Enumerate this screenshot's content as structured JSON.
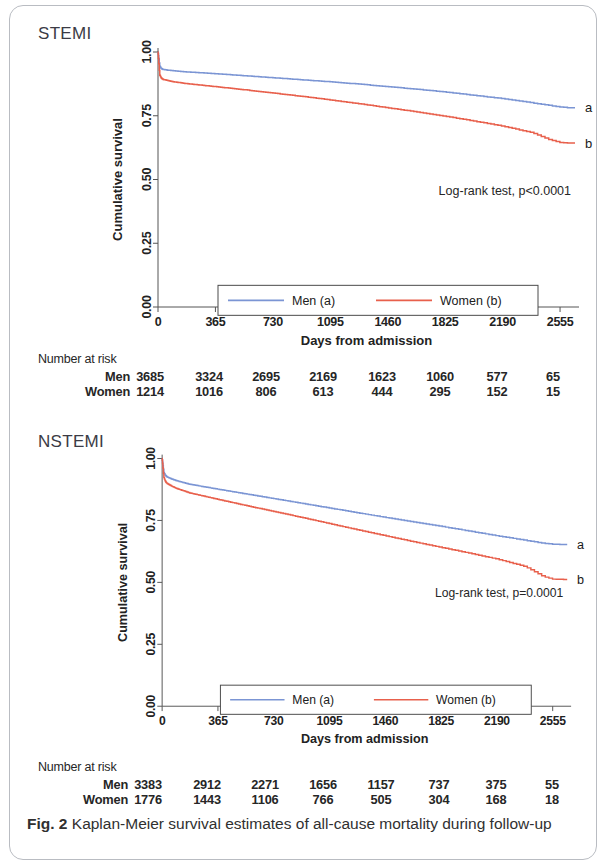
{
  "figure": {
    "caption_prefix": "Fig. 2",
    "caption_text": " Kaplan-Meier survival estimates of all-cause mortality during follow-up",
    "colors": {
      "men": "#7b95d4",
      "women": "#e8604c",
      "axis": "#555555",
      "frame": "#b9bcc2"
    }
  },
  "panels": [
    {
      "id": "stemi",
      "title": "STEMI",
      "annotation": "Log-rank test, p<0.0001",
      "curve_tags": {
        "men": "a",
        "women": "b"
      },
      "legend": {
        "men": "Men (a)",
        "women": "Women (b)"
      },
      "risk": {
        "heading": "Number at risk",
        "rows": [
          {
            "label": "Men",
            "values": [
              "3685",
              "3324",
              "2695",
              "2169",
              "1623",
              "1060",
              "577",
              "65"
            ]
          },
          {
            "label": "Women",
            "values": [
              "1214",
              "1016",
              "806",
              "613",
              "444",
              "295",
              "152",
              "15"
            ]
          }
        ]
      }
    },
    {
      "id": "nstemi",
      "title": "NSTEMI",
      "annotation": "Log-rank test, p=0.0001",
      "curve_tags": {
        "men": "a",
        "women": "b"
      },
      "legend": {
        "men": "Men (a)",
        "women": "Women (b)"
      },
      "risk": {
        "heading": "Number at risk",
        "rows": [
          {
            "label": "Men",
            "values": [
              "3383",
              "2912",
              "2271",
              "1656",
              "1157",
              "737",
              "375",
              "55"
            ]
          },
          {
            "label": "Women",
            "values": [
              "1776",
              "1443",
              "1106",
              "766",
              "505",
              "304",
              "168",
              "18"
            ]
          }
        ]
      }
    }
  ],
  "chart_data": [
    {
      "type": "line",
      "title": "STEMI",
      "subtitle": "Kaplan-Meier cumulative survival, STEMI patients",
      "xlabel": "Days from admission",
      "ylabel": "Cumulative survival",
      "xlim": [
        0,
        2650
      ],
      "ylim": [
        0,
        1
      ],
      "xticks": [
        0,
        365,
        730,
        1095,
        1460,
        1825,
        2190,
        2555
      ],
      "xticklabels": [
        "0",
        "365",
        "730",
        "1095",
        "1460",
        "1825",
        "2190",
        "2555"
      ],
      "yticks": [
        0.0,
        0.25,
        0.5,
        0.75,
        1.0
      ],
      "yticklabels": [
        "0.00",
        "0.25",
        "0.50",
        "0.75",
        "1.00"
      ],
      "grid": false,
      "legend_position": "lower center",
      "annotations": [
        "Log-rank test, p<0.0001"
      ],
      "series": [
        {
          "name": "Men (a)",
          "tag": "a",
          "color": "#7b95d4",
          "x": [
            0,
            10,
            20,
            30,
            60,
            90,
            180,
            365,
            548,
            730,
            913,
            1095,
            1278,
            1460,
            1643,
            1825,
            2008,
            2190,
            2373,
            2555,
            2620
          ],
          "y": [
            1.0,
            0.945,
            0.935,
            0.932,
            0.929,
            0.927,
            0.922,
            0.915,
            0.907,
            0.899,
            0.891,
            0.883,
            0.874,
            0.864,
            0.854,
            0.843,
            0.83,
            0.817,
            0.801,
            0.784,
            0.781
          ]
        },
        {
          "name": "Women (b)",
          "tag": "b",
          "color": "#e8604c",
          "x": [
            0,
            10,
            20,
            30,
            60,
            90,
            180,
            365,
            548,
            730,
            913,
            1095,
            1278,
            1460,
            1643,
            1825,
            2008,
            2190,
            2373,
            2490,
            2555,
            2620
          ],
          "y": [
            1.0,
            0.91,
            0.898,
            0.893,
            0.888,
            0.884,
            0.876,
            0.864,
            0.852,
            0.839,
            0.826,
            0.812,
            0.797,
            0.781,
            0.765,
            0.748,
            0.729,
            0.709,
            0.684,
            0.655,
            0.645,
            0.643
          ]
        }
      ],
      "risk_table": {
        "heading": "Number at risk",
        "times": [
          0,
          365,
          730,
          1095,
          1460,
          1825,
          2190,
          2555
        ],
        "rows": [
          {
            "label": "Men",
            "values": [
              3685,
              3324,
              2695,
              2169,
              1623,
              1060,
              577,
              65
            ]
          },
          {
            "label": "Women",
            "values": [
              1214,
              1016,
              806,
              613,
              444,
              295,
              152,
              15
            ]
          }
        ]
      }
    },
    {
      "type": "line",
      "title": "NSTEMI",
      "subtitle": "Kaplan-Meier cumulative survival, NSTEMI patients",
      "xlabel": "Days from admission",
      "ylabel": "Cumulative survival",
      "xlim": [
        0,
        2650
      ],
      "ylim": [
        0,
        1
      ],
      "xticks": [
        0,
        365,
        730,
        1095,
        1460,
        1825,
        2190,
        2555
      ],
      "xticklabels": [
        "0",
        "365",
        "730",
        "1095",
        "1460",
        "1825",
        "2190",
        "2555"
      ],
      "yticks": [
        0.0,
        0.25,
        0.5,
        0.75,
        1.0
      ],
      "yticklabels": [
        "0.00",
        "0.25",
        "0.50",
        "0.75",
        "1.00"
      ],
      "grid": false,
      "legend_position": "lower center",
      "annotations": [
        "Log-rank test, p=0.0001"
      ],
      "series": [
        {
          "name": "Men (a)",
          "tag": "a",
          "color": "#7b95d4",
          "x": [
            0,
            10,
            20,
            30,
            60,
            90,
            180,
            365,
            548,
            730,
            913,
            1095,
            1278,
            1460,
            1643,
            1825,
            2008,
            2190,
            2373,
            2490,
            2555,
            2620
          ],
          "y": [
            1.0,
            0.945,
            0.932,
            0.926,
            0.918,
            0.911,
            0.896,
            0.876,
            0.857,
            0.838,
            0.819,
            0.8,
            0.781,
            0.762,
            0.744,
            0.726,
            0.707,
            0.688,
            0.67,
            0.658,
            0.654,
            0.653
          ]
        },
        {
          "name": "Women (b)",
          "tag": "b",
          "color": "#e8604c",
          "x": [
            0,
            10,
            20,
            30,
            60,
            90,
            180,
            365,
            548,
            730,
            913,
            1095,
            1278,
            1460,
            1643,
            1825,
            2008,
            2190,
            2373,
            2490,
            2555,
            2620
          ],
          "y": [
            1.0,
            0.925,
            0.908,
            0.9,
            0.889,
            0.88,
            0.861,
            0.835,
            0.81,
            0.786,
            0.762,
            0.737,
            0.712,
            0.688,
            0.664,
            0.641,
            0.618,
            0.594,
            0.564,
            0.524,
            0.513,
            0.512
          ]
        }
      ],
      "risk_table": {
        "heading": "Number at risk",
        "times": [
          0,
          365,
          730,
          1095,
          1460,
          1825,
          2190,
          2555
        ],
        "rows": [
          {
            "label": "Men",
            "values": [
              3383,
              2912,
              2271,
              1656,
              1157,
              737,
              375,
              55
            ]
          },
          {
            "label": "Women",
            "values": [
              1776,
              1443,
              1106,
              766,
              505,
              304,
              168,
              18
            ]
          }
        ]
      }
    }
  ]
}
